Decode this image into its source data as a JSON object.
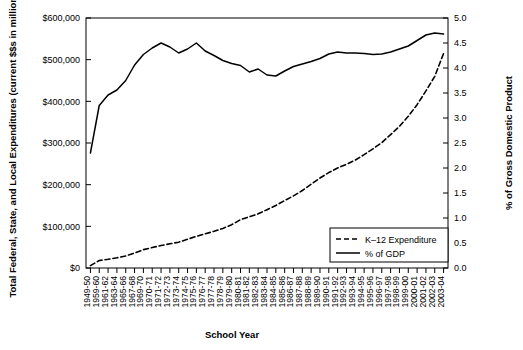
{
  "chart_data": {
    "type": "line",
    "title": "",
    "xlabel": "School Year",
    "ylabel": "Total Federal, State, and Local Expenditures (current $$s in millions)",
    "y2label": "% of Gross Domestic Product",
    "ylim": [
      0,
      600000
    ],
    "y2lim": [
      0,
      5.0
    ],
    "ytick_labels": [
      "$600,000",
      "$500,000",
      "$400,000",
      "$300,000",
      "$200,000",
      "$100,000",
      "$0"
    ],
    "ytick_values": [
      600000,
      500000,
      400000,
      300000,
      200000,
      100000,
      0
    ],
    "y2tick_labels": [
      "5.0",
      "4.5",
      "4.0",
      "3.5",
      "3.0",
      "2.5",
      "2.0",
      "1.5",
      "1.0",
      "0.5",
      "0.0"
    ],
    "y2tick_values": [
      5.0,
      4.5,
      4.0,
      3.5,
      3.0,
      2.5,
      2.0,
      1.5,
      1.0,
      0.5,
      0.0
    ],
    "grid": false,
    "legend_position": "bottom-right",
    "categories": [
      "1949-50",
      "1959-60",
      "1961-62",
      "1963-64",
      "1965-66",
      "1967-68",
      "1969-70",
      "1970-71",
      "1971-72",
      "1972-73",
      "1973-74",
      "1974-75",
      "1975-76",
      "1976-77",
      "1977-78",
      "1978-79",
      "1979-80",
      "1980-81",
      "1981-82",
      "1982-83",
      "1983-84",
      "1984-85",
      "1985-86",
      "1986-87",
      "1987-88",
      "1988-89",
      "1989-90",
      "1990-91",
      "1991-92",
      "1992-93",
      "1993-94",
      "1994-95",
      "1995-96",
      "1996-97",
      "1997-98",
      "1998-99",
      "1999-00",
      "2000-01",
      "2001-02",
      "2002-03",
      "2003-04"
    ],
    "series": [
      {
        "name": "K-12 Expenditure",
        "axis": "left",
        "style": "dashed",
        "color": "#000000",
        "values": [
          5800,
          18000,
          21000,
          24500,
          29000,
          36000,
          44000,
          49000,
          54000,
          58000,
          62000,
          69000,
          76000,
          82000,
          88000,
          95000,
          104000,
          116000,
          123000,
          130000,
          140000,
          150000,
          162000,
          173000,
          186000,
          201000,
          216000,
          229000,
          240000,
          249000,
          259000,
          272000,
          286000,
          301000,
          320000,
          340000,
          364000,
          392000,
          425000,
          460000,
          515000
        ]
      },
      {
        "name": "% of GDP",
        "axis": "right",
        "style": "solid",
        "color": "#000000",
        "values": [
          2.3,
          3.25,
          3.46,
          3.56,
          3.75,
          4.06,
          4.27,
          4.4,
          4.5,
          4.42,
          4.3,
          4.38,
          4.5,
          4.34,
          4.25,
          4.15,
          4.09,
          4.05,
          3.92,
          3.98,
          3.86,
          3.84,
          3.94,
          4.03,
          4.08,
          4.13,
          4.19,
          4.28,
          4.32,
          4.3,
          4.3,
          4.29,
          4.27,
          4.28,
          4.32,
          4.38,
          4.44,
          4.55,
          4.66,
          4.7,
          4.68
        ]
      }
    ],
    "legend": [
      {
        "label": "K–12 Expenditure",
        "style": "dashed"
      },
      {
        "label": "% of GDP",
        "style": "solid"
      }
    ]
  }
}
